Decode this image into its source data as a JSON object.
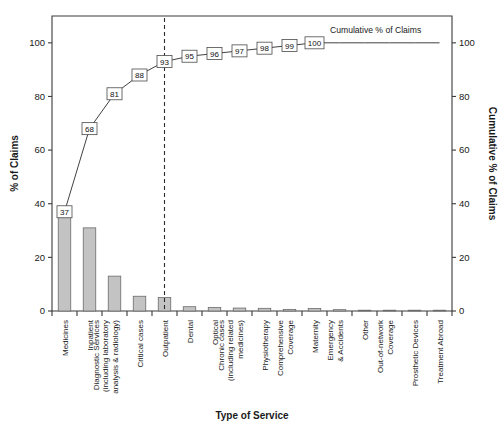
{
  "chart_data": {
    "type": "bar",
    "title": "",
    "xlabel": "Type of Service",
    "ylabel": "% of Claims",
    "y2label": "Cumulative % of Claims",
    "ylim": [
      0,
      110
    ],
    "y2lim": [
      0,
      110
    ],
    "yticks": [
      0,
      20,
      40,
      60,
      80,
      100
    ],
    "y2ticks": [
      0,
      20,
      40,
      60,
      80,
      100
    ],
    "grid": false,
    "legend_position": "inside-top-right",
    "annotation": "Cumulative % of Claims",
    "categories": [
      "Medicines",
      "Inpatient",
      "Diagnostic Services (including laboratory analysis & radiology)",
      "Critical cases",
      "Outpatient",
      "Dental",
      "Optical",
      "Chronic cases (including related medicines)",
      "Physiotherapy",
      "Comprehensive Coverage",
      "Maternity",
      "Emergency & Accidents",
      "Other",
      "Out-of-network Coverage",
      "Prosthetic Devices",
      "Treatment Abroad"
    ],
    "category_lines": [
      [
        "Medicines"
      ],
      [
        "Inpatient"
      ],
      [
        "Diagnostic Services",
        "(including laboratory",
        "analysis & radiology)"
      ],
      [
        "Critical cases"
      ],
      [
        "Outpatient"
      ],
      [
        "Dental"
      ],
      [
        "Optical"
      ],
      [
        "Chronic cases",
        "(including related",
        "medicines)"
      ],
      [
        "Physiotherapy"
      ],
      [
        "Comprehensive",
        "Coverage"
      ],
      [
        "Maternity"
      ],
      [
        "Emergency",
        "& Accidents"
      ],
      [
        "Other"
      ],
      [
        "Out-of-network",
        "Coverage"
      ],
      [
        "Prosthetic Devices"
      ],
      [
        "Treatment Abroad"
      ]
    ],
    "series": [
      {
        "name": "% of Claims",
        "kind": "bar",
        "values": [
          37,
          31,
          13,
          5.5,
          5,
          1.6,
          1.3,
          1.1,
          1.0,
          0.6,
          0.9,
          0.5,
          0.3,
          0.2,
          0.15,
          0.1
        ]
      },
      {
        "name": "Cumulative % of Claims",
        "kind": "line",
        "values": [
          37,
          68,
          81,
          88,
          93,
          95,
          96,
          97,
          98,
          99,
          100,
          100,
          100,
          100,
          100,
          100
        ],
        "labels": [
          37,
          68,
          81,
          88,
          93,
          95,
          96,
          97,
          98,
          99,
          100,
          null,
          null,
          null,
          null,
          null
        ]
      }
    ],
    "reference_line": {
      "category": "Outpatient",
      "style": "dashed"
    },
    "colors": {
      "bar_fill": "#c3c3c3",
      "bar_stroke": "#6b6b6b",
      "line": "#2b2b2b",
      "axis": "#3a3a3a"
    }
  }
}
